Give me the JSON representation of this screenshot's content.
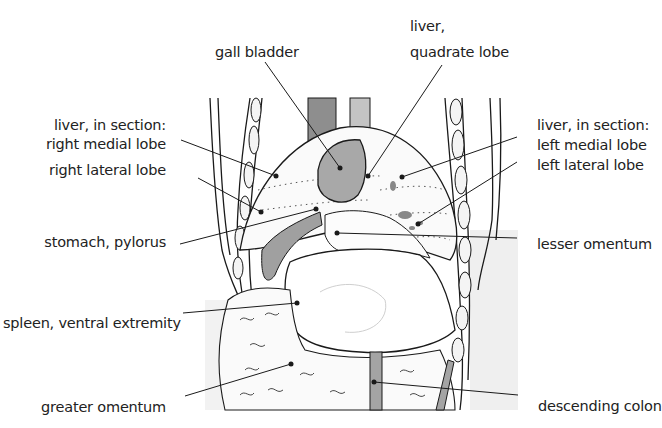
{
  "diagram": {
    "labels": {
      "gall_bladder": "gall bladder",
      "liver_quadrate_1": "liver,",
      "liver_quadrate_2": "quadrate lobe",
      "liver_section_right": "liver, in section:",
      "right_medial_lobe": "right medial lobe",
      "right_lateral_lobe": "right lateral lobe",
      "liver_section_left": "liver, in section:",
      "left_medial_lobe": "left medial lobe",
      "left_lateral_lobe": "left lateral lobe",
      "stomach_pylorus": "stomach, pylorus",
      "lesser_omentum": "lesser omentum",
      "spleen": "spleen, ventral extremity",
      "greater_omentum": "greater omentum",
      "descending_colon": "descending colon"
    },
    "colors": {
      "ink": "#1a1a1a",
      "organ_gray": "#9a9a9a",
      "light_gray": "#c8c8c8",
      "shade": "#ededed",
      "background": "#ffffff"
    }
  }
}
